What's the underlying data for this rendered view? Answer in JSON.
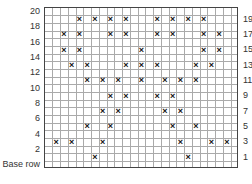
{
  "chart_data": {
    "type": "grid-pattern",
    "title": "",
    "columns": 25,
    "rows": 21,
    "row_labels_left": [
      "20",
      "18",
      "16",
      "14",
      "12",
      "10",
      "8",
      "6",
      "4",
      "2",
      "Base row"
    ],
    "row_labels_right": [
      "19",
      "17",
      "15",
      "13",
      "11",
      "9",
      "7",
      "5",
      "3",
      "1"
    ],
    "symbol": "×",
    "marks_by_row": {
      "19": [
        4,
        6,
        8,
        10,
        14,
        16,
        18,
        20
      ],
      "17": [
        2,
        4,
        8,
        10,
        14,
        16,
        20,
        22
      ],
      "15": [
        2,
        4,
        12,
        20,
        22
      ],
      "13": [
        3,
        5,
        10,
        12,
        14,
        19,
        21
      ],
      "11": [
        5,
        7,
        9,
        12,
        15,
        17,
        19
      ],
      "9": [
        8,
        10,
        14,
        16
      ],
      "7": [
        7,
        9,
        15,
        17
      ],
      "5": [
        5,
        8,
        16,
        19
      ],
      "3": [
        1,
        3,
        7,
        17,
        21,
        23
      ],
      "1": [
        6,
        18
      ]
    },
    "note": "columns are 0-indexed from left; rows numbered with Base row = 0"
  },
  "labels": {
    "left": [
      {
        "text": "20",
        "row": 20
      },
      {
        "text": "18",
        "row": 18
      },
      {
        "text": "16",
        "row": 16
      },
      {
        "text": "14",
        "row": 14
      },
      {
        "text": "12",
        "row": 12
      },
      {
        "text": "10",
        "row": 10
      },
      {
        "text": "8",
        "row": 8
      },
      {
        "text": "6",
        "row": 6
      },
      {
        "text": "4",
        "row": 4
      },
      {
        "text": "2",
        "row": 2
      },
      {
        "text": "Base row",
        "row": 0
      }
    ],
    "right": [
      {
        "text": "19",
        "row": 19
      },
      {
        "text": "17",
        "row": 17
      },
      {
        "text": "15",
        "row": 15
      },
      {
        "text": "13",
        "row": 13
      },
      {
        "text": "11",
        "row": 11
      },
      {
        "text": "9",
        "row": 9
      },
      {
        "text": "7",
        "row": 7
      },
      {
        "text": "5",
        "row": 5
      },
      {
        "text": "3",
        "row": 3
      },
      {
        "text": "1",
        "row": 1
      }
    ]
  },
  "colors": {
    "grid_line": "#aaaaaa",
    "border": "#444444",
    "mark": "#111111",
    "label": "#333333"
  }
}
